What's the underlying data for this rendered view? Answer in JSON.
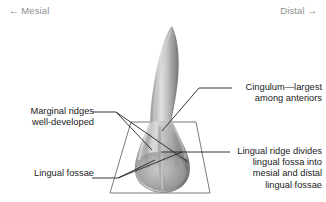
{
  "figure": {
    "type": "dental-anatomy-diagram",
    "orientation": {
      "left_label": "← Mesial",
      "right_label": "Distal →"
    },
    "annotations": [
      {
        "id": "marginal-ridges",
        "lines": [
          "Marginal ridges",
          "well-developed"
        ],
        "side": "left"
      },
      {
        "id": "lingual-fossae",
        "lines": [
          "Lingual fossae"
        ],
        "side": "left"
      },
      {
        "id": "cingulum",
        "lines": [
          "Cingulum—largest",
          "among anteriors"
        ],
        "side": "right"
      },
      {
        "id": "lingual-ridge",
        "lines": [
          "Lingual ridge divides",
          "lingual fossa into",
          "mesial and distal",
          "lingual fossae"
        ],
        "side": "right"
      }
    ],
    "colors": {
      "background": "#ffffff",
      "orientation_text": "#8d8d8d",
      "annotation_text": "#1b1b1b",
      "leader_line": "#222222",
      "outline_trapezoid": "#7b7b7b",
      "tooth_light": "#e4e4e4",
      "tooth_mid": "#a9a9a9",
      "tooth_dark": "#6f6f6f"
    }
  }
}
